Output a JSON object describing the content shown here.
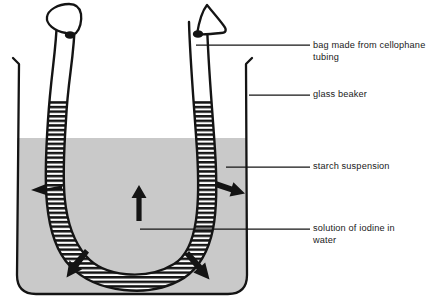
{
  "diagram": {
    "colors": {
      "ink": "#141414",
      "starch_suspension_fill": "#c9c9c9",
      "iodine_hatch": "#141414",
      "bag_interior": "#ffffff",
      "background": "#ffffff"
    },
    "labels": [
      {
        "id": "bag",
        "text": "bag made from cellophane\ntubing",
        "leader": {
          "x1": 196,
          "y1": 45,
          "x2": 310,
          "y2": 45
        }
      },
      {
        "id": "glass_beaker",
        "text": "glass beaker",
        "leader": {
          "x1": 249,
          "y1": 95,
          "x2": 310,
          "y2": 95
        }
      },
      {
        "id": "starch_suspension",
        "text": "starch suspension",
        "leader": {
          "x1": 226,
          "y1": 167,
          "x2": 310,
          "y2": 167
        }
      },
      {
        "id": "iodine_solution",
        "text": "solution of iodine in\nwater",
        "leader": {
          "x1": 140,
          "y1": 229,
          "x2": 310,
          "y2": 229
        }
      }
    ],
    "beaker": {
      "name": "glass beaker",
      "left_wall_x": 16,
      "right_wall_x": 248,
      "rim_y": 57,
      "base_y": 295,
      "liquid_level_y": 138,
      "contents": "starch suspension"
    },
    "bag": {
      "name": "cellophane tubing bag",
      "shape": "U-tube",
      "contents": "solution of iodine in water",
      "iodine_level_y": 100,
      "left_arm_x": 72,
      "right_arm_x": 178,
      "bottom_y": 276,
      "knots": [
        {
          "id": "left-knot",
          "shape": "fan",
          "x": 64,
          "y": 22
        },
        {
          "id": "right-knot",
          "shape": "triangle",
          "x": 200,
          "y": 22
        }
      ]
    },
    "arrows": [
      {
        "id": "arrow-left",
        "direction": "left",
        "from": [
          62,
          187
        ],
        "to": [
          32,
          190
        ]
      },
      {
        "id": "arrow-center-up",
        "direction": "up",
        "from": [
          139,
          221
        ],
        "to": [
          139,
          186
        ]
      },
      {
        "id": "arrow-right",
        "direction": "right-down",
        "from": [
          216,
          182
        ],
        "to": [
          248,
          194
        ]
      },
      {
        "id": "arrow-bottom-left",
        "direction": "down-left",
        "from": [
          84,
          250
        ],
        "to": [
          58,
          279
        ]
      },
      {
        "id": "arrow-bottom-right",
        "direction": "down-right",
        "from": [
          190,
          252
        ],
        "to": [
          214,
          283
        ]
      }
    ]
  }
}
